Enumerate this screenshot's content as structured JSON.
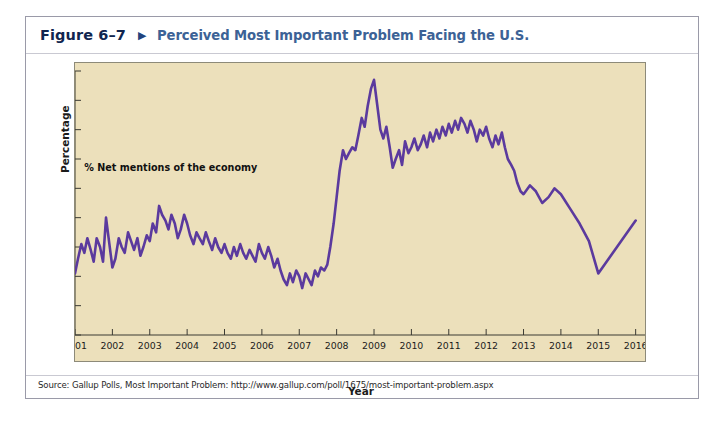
{
  "figure": {
    "number": "Figure 6–7",
    "arrow_icon": "triangle-right-icon",
    "title": "Perceived Most Important Problem Facing the U.S.",
    "source": "Source: Gallup Polls, Most Important Problem: http://www.gallup.com/poll/1675/most-important-problem.aspx"
  },
  "colors": {
    "panel_background": "#ece0bb",
    "line": "#5b3a9e",
    "title_blue": "#3c6296",
    "figure_number": "#10254f",
    "axis": "#3b3a33"
  },
  "chart_data": {
    "type": "line",
    "title": "Perceived Most Important Problem Facing the U.S.",
    "xlabel": "Year",
    "ylabel": "Percentage",
    "annotation": "% Net mentions of the economy",
    "xlim": [
      2001,
      2016.25
    ],
    "ylim": [
      0,
      90
    ],
    "ytick_values": [
      0,
      10,
      20,
      30,
      40,
      50,
      60,
      70,
      80,
      90
    ],
    "ytick_labels": [
      "0",
      "10",
      "20",
      "30",
      "40",
      "50",
      "60",
      "70",
      "80",
      "90"
    ],
    "xtick_values": [
      2001,
      2002,
      2003,
      2004,
      2005,
      2006,
      2007,
      2008,
      2009,
      2010,
      2011,
      2012,
      2013,
      2014,
      2015,
      2016
    ],
    "xtick_labels": [
      "2001",
      "2002",
      "2003",
      "2004",
      "2005",
      "2006",
      "2007",
      "2008",
      "2009",
      "2010",
      "2011",
      "2012",
      "2013",
      "2014",
      "2015",
      "2016"
    ],
    "grid": false,
    "legend": "none",
    "series": [
      {
        "name": "% Net mentions of the economy",
        "color": "#5b3a9e",
        "x": [
          2001.0,
          2001.08,
          2001.17,
          2001.25,
          2001.33,
          2001.42,
          2001.5,
          2001.58,
          2001.67,
          2001.75,
          2001.83,
          2001.92,
          2002.0,
          2002.08,
          2002.17,
          2002.25,
          2002.33,
          2002.42,
          2002.5,
          2002.58,
          2002.67,
          2002.75,
          2002.83,
          2002.92,
          2003.0,
          2003.08,
          2003.17,
          2003.25,
          2003.33,
          2003.42,
          2003.5,
          2003.58,
          2003.67,
          2003.75,
          2003.83,
          2003.92,
          2004.0,
          2004.08,
          2004.17,
          2004.25,
          2004.33,
          2004.42,
          2004.5,
          2004.58,
          2004.67,
          2004.75,
          2004.83,
          2004.92,
          2005.0,
          2005.08,
          2005.17,
          2005.25,
          2005.33,
          2005.42,
          2005.5,
          2005.58,
          2005.67,
          2005.75,
          2005.83,
          2005.92,
          2006.0,
          2006.08,
          2006.17,
          2006.25,
          2006.33,
          2006.42,
          2006.5,
          2006.58,
          2006.67,
          2006.75,
          2006.83,
          2006.92,
          2007.0,
          2007.08,
          2007.17,
          2007.25,
          2007.33,
          2007.42,
          2007.5,
          2007.58,
          2007.67,
          2007.75,
          2007.83,
          2007.92,
          2008.0,
          2008.08,
          2008.17,
          2008.25,
          2008.33,
          2008.42,
          2008.5,
          2008.58,
          2008.67,
          2008.75,
          2008.83,
          2008.92,
          2009.0,
          2009.08,
          2009.17,
          2009.25,
          2009.33,
          2009.42,
          2009.5,
          2009.58,
          2009.67,
          2009.75,
          2009.83,
          2009.92,
          2010.0,
          2010.08,
          2010.17,
          2010.25,
          2010.33,
          2010.42,
          2010.5,
          2010.58,
          2010.67,
          2010.75,
          2010.83,
          2010.92,
          2011.0,
          2011.08,
          2011.17,
          2011.25,
          2011.33,
          2011.42,
          2011.5,
          2011.58,
          2011.67,
          2011.75,
          2011.83,
          2011.92,
          2012.0,
          2012.08,
          2012.17,
          2012.25,
          2012.33,
          2012.42,
          2012.5,
          2012.58,
          2012.67,
          2012.75,
          2012.83,
          2012.92,
          2013.0,
          2013.17,
          2013.33,
          2013.5,
          2013.67,
          2013.83,
          2014.0,
          2014.25,
          2014.5,
          2014.75,
          2015.0,
          2015.5,
          2016.0
        ],
        "y": [
          21,
          26,
          31,
          28,
          33,
          29,
          25,
          33,
          30,
          25,
          40,
          31,
          23,
          26,
          33,
          30,
          28,
          35,
          32,
          29,
          33,
          27,
          30,
          34,
          32,
          38,
          35,
          44,
          41,
          39,
          36,
          41,
          38,
          33,
          36,
          41,
          38,
          34,
          31,
          35,
          33,
          31,
          35,
          32,
          29,
          33,
          30,
          28,
          31,
          28,
          26,
          30,
          27,
          31,
          28,
          26,
          29,
          27,
          25,
          31,
          28,
          26,
          30,
          27,
          23,
          26,
          22,
          19,
          17,
          21,
          18,
          22,
          20,
          16,
          21,
          19,
          17,
          22,
          20,
          23,
          22,
          24,
          30,
          38,
          47,
          56,
          63,
          60,
          62,
          64,
          63,
          68,
          74,
          71,
          78,
          84,
          87,
          79,
          70,
          67,
          71,
          64,
          57,
          60,
          63,
          58,
          66,
          62,
          64,
          67,
          63,
          65,
          68,
          64,
          69,
          66,
          70,
          67,
          71,
          68,
          72,
          69,
          73,
          70,
          74,
          72,
          69,
          73,
          70,
          66,
          70,
          68,
          71,
          67,
          64,
          68,
          65,
          69,
          64,
          60,
          58,
          56,
          52,
          49,
          48,
          51,
          49,
          45,
          47,
          50,
          48,
          43,
          38,
          32,
          21,
          30,
          39
        ]
      }
    ]
  }
}
